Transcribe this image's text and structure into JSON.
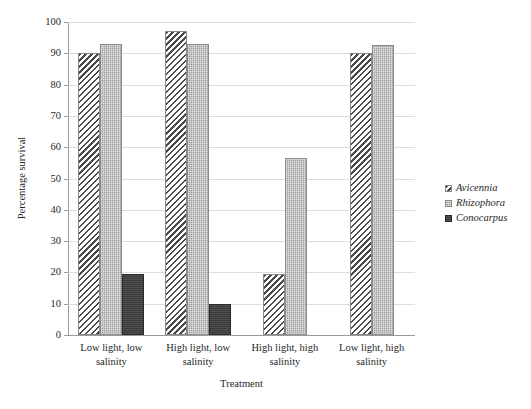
{
  "chart_data": {
    "type": "bar",
    "title": "",
    "xlabel": "Treatment",
    "ylabel": "Percentage survival",
    "ylim": [
      0,
      100
    ],
    "yticks": [
      0,
      10,
      20,
      30,
      40,
      50,
      60,
      70,
      80,
      90,
      100
    ],
    "grid": true,
    "legend_position": "right",
    "categories": [
      "Low light, low salinity",
      "High light, low salinity",
      "High light, high salinity",
      "Low light, high salinity"
    ],
    "category_lines": [
      [
        "Low light, low",
        "salinity"
      ],
      [
        "High light, low",
        "salinity"
      ],
      [
        "High light, high",
        "salinity"
      ],
      [
        "Low light, high",
        "salinity"
      ]
    ],
    "series": [
      {
        "name": "Avicennia",
        "fill": "diagonal-hatch",
        "color": "#4a4a4a",
        "values": [
          90,
          97,
          19.5,
          90
        ]
      },
      {
        "name": "Rhizophora",
        "fill": "stipple-gray",
        "color": "#9f9f9f",
        "values": [
          93,
          93,
          56.5,
          92.5
        ]
      },
      {
        "name": "Conocarpus",
        "fill": "solid-dark",
        "color": "#3b3b3b",
        "values": [
          19.5,
          10,
          0,
          0
        ]
      }
    ]
  },
  "axes": {
    "y_tick_labels": [
      "0",
      "10",
      "20",
      "30",
      "40",
      "50",
      "60",
      "70",
      "80",
      "90",
      "100"
    ],
    "y_title": "Percentage survival",
    "x_title": "Treatment"
  },
  "legend": {
    "items": [
      {
        "label": "Avicennia",
        "swatch": "hatch-swatch"
      },
      {
        "label": "Rhizophora",
        "swatch": "stipple-swatch"
      },
      {
        "label": "Conocarpus",
        "swatch": "solid-swatch"
      }
    ]
  }
}
